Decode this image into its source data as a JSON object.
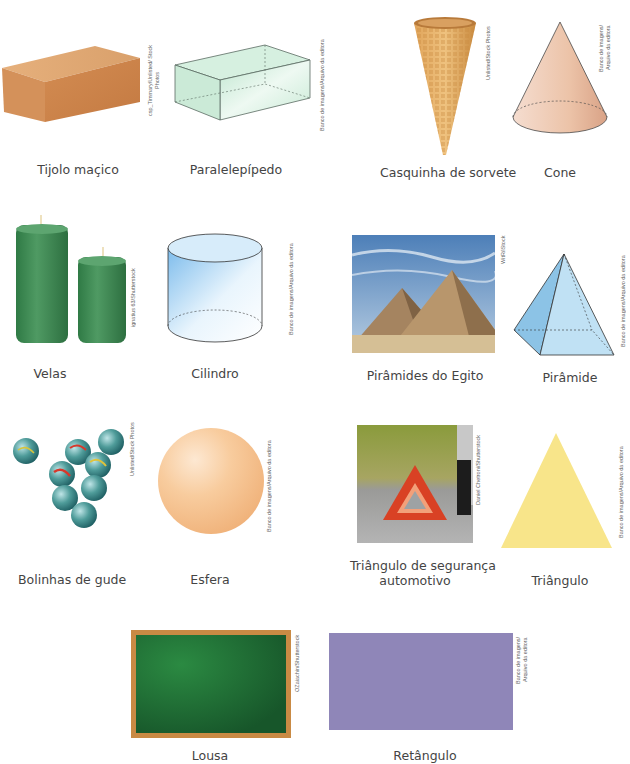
{
  "page": {
    "background": "#ffffff",
    "items": [
      {
        "label": "Tijolo maçico",
        "credit": "csp_Timmary/Unlisted/ Stock Photos",
        "kind": "photo",
        "color": "#d7935a"
      },
      {
        "label": "Paralelepípedo",
        "credit": "Banco de imagens/Arquivo da editora",
        "kind": "diagram",
        "color": "#c9ecd8"
      },
      {
        "label": "Casquinha de sorvete",
        "credit": "Unlisted/Stock Photos",
        "kind": "photo",
        "color": "#d89d55"
      },
      {
        "label": "Cone",
        "credit": "Banco de imagens/ Arquivo da editora",
        "kind": "diagram",
        "color": "#eac0a6"
      },
      {
        "label": "Velas",
        "credit": "ignatius 63/Shutterstock",
        "kind": "photo",
        "color": "#3f8a53"
      },
      {
        "label": "Cilindro",
        "credit": "Banco de imagens/Arquivo da editora",
        "kind": "diagram",
        "color": "#9fcff0"
      },
      {
        "label": "Pirâmides do Egito",
        "credit": "WitR/iStock",
        "kind": "photo",
        "color": "#b3926a"
      },
      {
        "label": "Pirâmide",
        "credit": "Banco de imagens/Arquivo da editora",
        "kind": "diagram",
        "color": "#a9d4ec"
      },
      {
        "label": "Bolinhas de gude",
        "credit": "Unlisted/Stock Photos",
        "kind": "photo",
        "color": "#3f8f86"
      },
      {
        "label": "Esfera",
        "credit": "Banco de imagens/Arquivo da editora",
        "kind": "diagram",
        "color": "#f6c38e"
      },
      {
        "label": "Triângulo de segurança automotivo",
        "label_line1": "Triângulo de segurança",
        "label_line2": "automotivo",
        "credit": "Daniel Chetroni/Shutterstock",
        "kind": "photo",
        "color": "#d8432a"
      },
      {
        "label": "Triângulo",
        "credit": "Banco de imagens/Arquivo da editora",
        "kind": "diagram",
        "color": "#f8e58a"
      },
      {
        "label": "Lousa",
        "credit": "OZaiachin/Shutterstock",
        "kind": "photo",
        "color": "#1e6b35"
      },
      {
        "label": "Retângulo",
        "credit": "Banco de imagens/ Arquivo da editora",
        "kind": "diagram",
        "color": "#8f86b8"
      }
    ]
  }
}
